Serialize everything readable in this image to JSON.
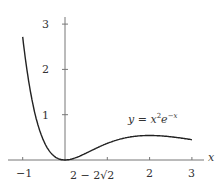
{
  "chart_data": {
    "type": "line",
    "title": "",
    "function": "y = x^2 e^{-x}",
    "annotation": "y = x²e⁻ˣ",
    "xlabel": "x",
    "ylabel": "",
    "xlim": [
      -1.05,
      3.2
    ],
    "ylim": [
      0,
      3.15
    ],
    "x_ticks": [
      -1,
      0.0,
      1,
      2,
      3
    ],
    "x_tick_labels": [
      "−1",
      "2 − 2√2",
      "",
      "2",
      "3"
    ],
    "y_ticks": [
      1,
      2,
      3
    ],
    "y_tick_labels": [
      "1",
      "2",
      "3"
    ],
    "grid": false,
    "legend": "none",
    "series": [
      {
        "name": "y = x^2 e^{-x}",
        "x": [
          -1,
          -0.75,
          -0.5,
          -0.25,
          0,
          0.25,
          0.5,
          0.75,
          1,
          1.5,
          2,
          2.5,
          3
        ],
        "values": [
          2.718,
          1.191,
          0.412,
          0.08,
          0,
          0.049,
          0.152,
          0.266,
          0.368,
          0.502,
          0.541,
          0.513,
          0.448
        ]
      }
    ]
  },
  "labels": {
    "x_axis": "x",
    "eq": "y = x",
    "eq_sup1": "2",
    "eq_e": "e",
    "eq_sup2": "−x",
    "tick_neg1": "−1",
    "tick_special": "2 − 2√2",
    "tick_2": "2",
    "tick_3": "3",
    "ytick_1": "1",
    "ytick_2": "2",
    "ytick_3": "3"
  }
}
